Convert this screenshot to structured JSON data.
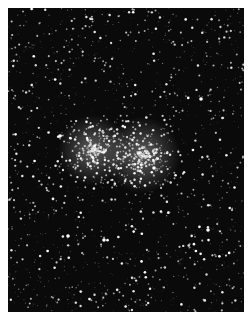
{
  "image": {
    "subject": "star field with double star cluster",
    "background_color": "#ffffff",
    "sky_color": "#0a0a0a",
    "frame": {
      "left": 8,
      "top": 8,
      "width": 236,
      "height": 304
    },
    "field_star_count": 1400,
    "clusters": [
      {
        "name": "cluster-left",
        "cx": 85,
        "cy": 142,
        "radius": 22,
        "count": 260
      },
      {
        "name": "cluster-right",
        "cx": 134,
        "cy": 147,
        "radius": 24,
        "count": 240
      }
    ],
    "bright_stars": [
      {
        "x": 193,
        "y": 91
      },
      {
        "x": 60,
        "y": 228
      },
      {
        "x": 96,
        "y": 232
      },
      {
        "x": 52,
        "y": 128
      },
      {
        "x": 200,
        "y": 222
      },
      {
        "x": 146,
        "y": 160
      }
    ]
  }
}
